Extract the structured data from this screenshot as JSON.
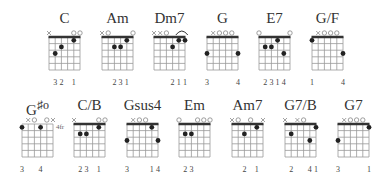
{
  "colors": {
    "line": "#999999",
    "nut": "#333333",
    "dot": "#222222",
    "text": "#333333"
  },
  "rows": [
    {
      "chords": [
        {
          "name": "C",
          "x": 49,
          "y": 37,
          "nut": true,
          "markers": [
            "x",
            "",
            "",
            "",
            "o",
            "o"
          ],
          "dots": [
            [
              5,
              3
            ],
            [
              4,
              2
            ],
            [
              2,
              1
            ]
          ],
          "fingering": [
            "",
            "3",
            "2",
            "",
            "1",
            ""
          ]
        },
        {
          "name": "Am",
          "x": 102,
          "y": 37,
          "nut": true,
          "markers": [
            "x",
            "o",
            "",
            "",
            "",
            "o"
          ],
          "dots": [
            [
              4,
              2
            ],
            [
              3,
              2
            ],
            [
              2,
              1
            ]
          ],
          "fingering": [
            "",
            "",
            "2",
            "3",
            "1",
            ""
          ]
        },
        {
          "name": "Dm7",
          "x": 154,
          "y": 37,
          "nut": true,
          "markers": [
            "x",
            "x",
            "o",
            "",
            "^",
            ""
          ],
          "dots": [
            [
              3,
              2
            ],
            [
              2,
              1
            ],
            [
              1,
              1
            ]
          ],
          "fingering": [
            "",
            "",
            "",
            "2",
            "1",
            "1"
          ]
        },
        {
          "name": "G",
          "x": 207,
          "y": 37,
          "nut": true,
          "markers": [
            "",
            "x",
            "o",
            "o",
            "o",
            ""
          ],
          "dots": [
            [
              6,
              3
            ],
            [
              1,
              3
            ]
          ],
          "fingering": [
            "3",
            "",
            "",
            "",
            "",
            "4"
          ]
        },
        {
          "name": "E7",
          "x": 259,
          "y": 37,
          "nut": true,
          "markers": [
            "o",
            "",
            "",
            "",
            "",
            "o"
          ],
          "dots": [
            [
              5,
              2
            ],
            [
              4,
              2
            ],
            [
              3,
              1
            ],
            [
              2,
              3
            ]
          ],
          "fingering": [
            "",
            "2",
            "3",
            "1",
            "4",
            ""
          ]
        },
        {
          "name": "G/F",
          "x": 312,
          "y": 37,
          "nut": true,
          "markers": [
            "",
            "x",
            "o",
            "o",
            "o",
            ""
          ],
          "dots": [
            [
              6,
              1
            ],
            [
              1,
              3
            ]
          ],
          "fingering": [
            "1",
            "",
            "",
            "",
            "",
            "4"
          ]
        }
      ]
    },
    {
      "chords": [
        {
          "name": "G#o",
          "x": 22,
          "y": 124,
          "nut": false,
          "markers": [
            "",
            "x",
            "o",
            "",
            "o",
            "x"
          ],
          "dots": [
            [
              6,
              1
            ],
            [
              3,
              1
            ]
          ],
          "fingering": [
            "3",
            "",
            "",
            "4",
            "",
            ""
          ],
          "fret_label": "4fr"
        },
        {
          "name": "C/B",
          "x": 74,
          "y": 124,
          "nut": true,
          "markers": [
            "x",
            "",
            "",
            "",
            "o",
            "o"
          ],
          "dots": [
            [
              5,
              2
            ],
            [
              4,
              2
            ],
            [
              2,
              1
            ]
          ],
          "fingering": [
            "",
            "2",
            "3",
            "",
            "1",
            ""
          ]
        },
        {
          "name": "Gsus4",
          "x": 127,
          "y": 124,
          "nut": true,
          "markers": [
            "",
            "x",
            "o",
            "o",
            "",
            ""
          ],
          "dots": [
            [
              6,
              3
            ],
            [
              2,
              1
            ],
            [
              1,
              3
            ]
          ],
          "fingering": [
            "3",
            "",
            "",
            "",
            "1",
            "4"
          ]
        },
        {
          "name": "Em",
          "x": 179,
          "y": 124,
          "nut": true,
          "markers": [
            "o",
            "",
            "",
            "o",
            "o",
            "o"
          ],
          "dots": [
            [
              5,
              2
            ],
            [
              4,
              2
            ]
          ],
          "fingering": [
            "",
            "2",
            "3",
            "",
            "",
            ""
          ]
        },
        {
          "name": "Am7",
          "x": 232,
          "y": 124,
          "nut": true,
          "markers": [
            "x",
            "o",
            "",
            "o",
            "",
            "x"
          ],
          "dots": [
            [
              4,
              2
            ],
            [
              2,
              1
            ]
          ],
          "fingering": [
            "",
            "",
            "2",
            "",
            "1",
            ""
          ]
        },
        {
          "name": "G7/B",
          "x": 285,
          "y": 124,
          "nut": true,
          "markers": [
            "x",
            "",
            "x",
            "o",
            "",
            ""
          ],
          "dots": [
            [
              5,
              2
            ],
            [
              2,
              3
            ],
            [
              1,
              1
            ]
          ],
          "fingering": [
            "",
            "2",
            "",
            "",
            "4",
            "1"
          ]
        },
        {
          "name": "G7",
          "x": 338,
          "y": 124,
          "nut": true,
          "markers": [
            "",
            "x",
            "o",
            "o",
            "o",
            ""
          ],
          "dots": [
            [
              6,
              3
            ],
            [
              1,
              1
            ]
          ],
          "fingering": [
            "3",
            "",
            "",
            "",
            "",
            "1"
          ]
        }
      ]
    }
  ]
}
